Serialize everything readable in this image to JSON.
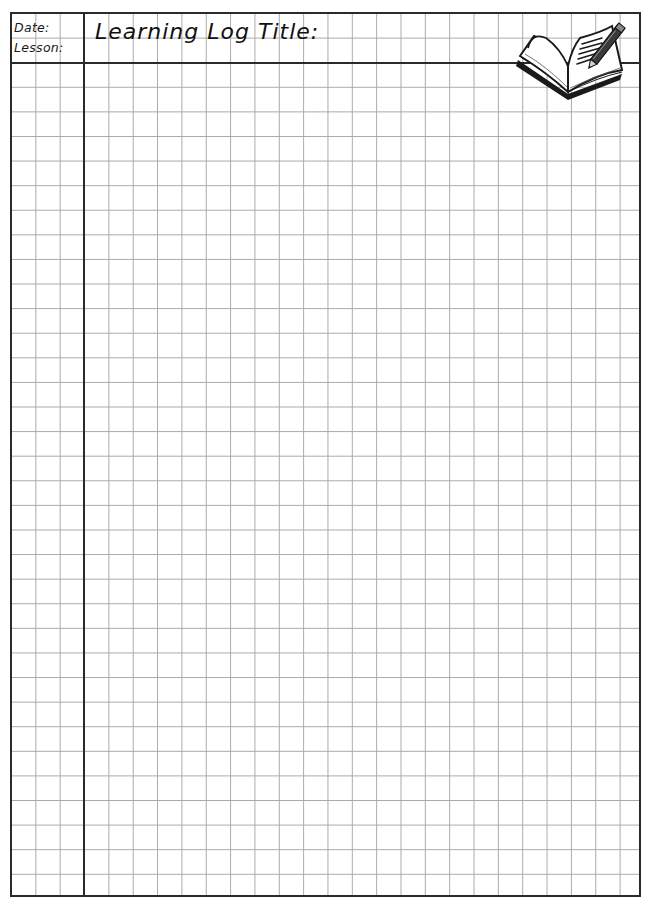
{
  "header": {
    "date_label": "Date:",
    "lesson_label": "Lesson:",
    "title_label": "Learning Log Title:",
    "icon": "open-book-with-pencil-icon"
  },
  "grid": {
    "columns": 26,
    "rows": 36,
    "left_margin_columns": 3,
    "header_rows": 2,
    "line_color": "#a9a9a9",
    "border_color": "#2a2a2a"
  },
  "footer": {
    "cut_off_text": ""
  }
}
